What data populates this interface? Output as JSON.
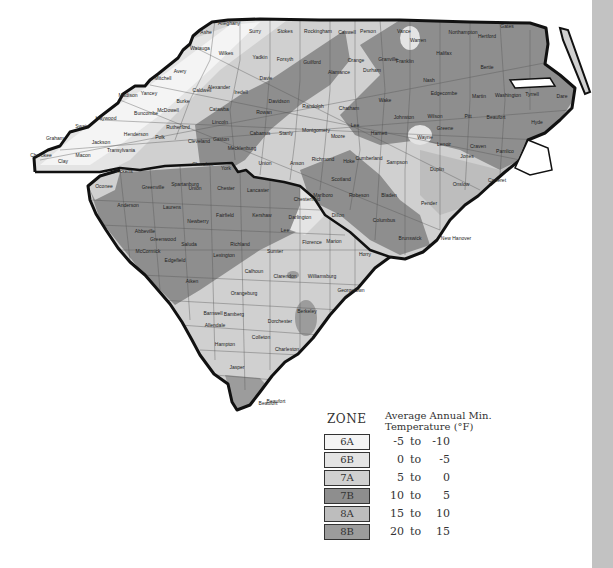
{
  "map": {
    "title": "USDA Plant Hardiness Zones — North Carolina & South Carolina",
    "states": [
      "North Carolina",
      "South Carolina"
    ],
    "nc_counties": [
      {
        "name": "Ashe",
        "x": 206,
        "y": 34
      },
      {
        "name": "Alleghany",
        "x": 229,
        "y": 25
      },
      {
        "name": "Surry",
        "x": 255,
        "y": 33
      },
      {
        "name": "Stokes",
        "x": 285,
        "y": 33
      },
      {
        "name": "Rockingham",
        "x": 318,
        "y": 33
      },
      {
        "name": "Caswell",
        "x": 347,
        "y": 34
      },
      {
        "name": "Person",
        "x": 368,
        "y": 33
      },
      {
        "name": "Vance",
        "x": 404,
        "y": 33
      },
      {
        "name": "Warren",
        "x": 418,
        "y": 42
      },
      {
        "name": "Northampton",
        "x": 463,
        "y": 34
      },
      {
        "name": "Hertford",
        "x": 487,
        "y": 38
      },
      {
        "name": "Gates",
        "x": 507,
        "y": 28
      },
      {
        "name": "Watauga",
        "x": 200,
        "y": 50
      },
      {
        "name": "Wilkes",
        "x": 226,
        "y": 55
      },
      {
        "name": "Yadkin",
        "x": 260,
        "y": 59
      },
      {
        "name": "Forsyth",
        "x": 285,
        "y": 61
      },
      {
        "name": "Guilford",
        "x": 312,
        "y": 64
      },
      {
        "name": "Alamance",
        "x": 339,
        "y": 74
      },
      {
        "name": "Orange",
        "x": 356,
        "y": 62
      },
      {
        "name": "Durham",
        "x": 372,
        "y": 72
      },
      {
        "name": "Granville",
        "x": 388,
        "y": 61
      },
      {
        "name": "Franklin",
        "x": 405,
        "y": 63
      },
      {
        "name": "Halifax",
        "x": 444,
        "y": 55
      },
      {
        "name": "Bertie",
        "x": 487,
        "y": 69
      },
      {
        "name": "Avery",
        "x": 180,
        "y": 73
      },
      {
        "name": "Mitchell",
        "x": 163,
        "y": 80
      },
      {
        "name": "Yancey",
        "x": 149,
        "y": 95
      },
      {
        "name": "Madison",
        "x": 128,
        "y": 97
      },
      {
        "name": "Caldwell",
        "x": 202,
        "y": 92
      },
      {
        "name": "Alexander",
        "x": 219,
        "y": 89
      },
      {
        "name": "Iredell",
        "x": 241,
        "y": 94
      },
      {
        "name": "Davie",
        "x": 266,
        "y": 80
      },
      {
        "name": "Davidson",
        "x": 279,
        "y": 103
      },
      {
        "name": "Randolph",
        "x": 313,
        "y": 108
      },
      {
        "name": "Chatham",
        "x": 349,
        "y": 110
      },
      {
        "name": "Wake",
        "x": 385,
        "y": 102
      },
      {
        "name": "Nash",
        "x": 429,
        "y": 82
      },
      {
        "name": "Edgecombe",
        "x": 444,
        "y": 95
      },
      {
        "name": "Martin",
        "x": 479,
        "y": 98
      },
      {
        "name": "Washington",
        "x": 508,
        "y": 97
      },
      {
        "name": "Tyrrell",
        "x": 532,
        "y": 96
      },
      {
        "name": "Dare",
        "x": 562,
        "y": 98
      },
      {
        "name": "Buncombe",
        "x": 146,
        "y": 115
      },
      {
        "name": "McDowell",
        "x": 168,
        "y": 112
      },
      {
        "name": "Burke",
        "x": 183,
        "y": 103
      },
      {
        "name": "Catawba",
        "x": 219,
        "y": 111
      },
      {
        "name": "Rowan",
        "x": 264,
        "y": 114
      },
      {
        "name": "Wilson",
        "x": 435,
        "y": 118
      },
      {
        "name": "Johnston",
        "x": 404,
        "y": 119
      },
      {
        "name": "Pitt",
        "x": 468,
        "y": 118
      },
      {
        "name": "Beaufort",
        "x": 496,
        "y": 119
      },
      {
        "name": "Hyde",
        "x": 537,
        "y": 124
      },
      {
        "name": "Haywood",
        "x": 106,
        "y": 120
      },
      {
        "name": "Swain",
        "x": 82,
        "y": 128
      },
      {
        "name": "Graham",
        "x": 55,
        "y": 140
      },
      {
        "name": "Cherokee",
        "x": 41,
        "y": 157
      },
      {
        "name": "Clay",
        "x": 63,
        "y": 163
      },
      {
        "name": "Macon",
        "x": 83,
        "y": 157
      },
      {
        "name": "Jackson",
        "x": 101,
        "y": 144
      },
      {
        "name": "Henderson",
        "x": 136,
        "y": 136
      },
      {
        "name": "Transylvania",
        "x": 121,
        "y": 152
      },
      {
        "name": "Polk",
        "x": 160,
        "y": 139
      },
      {
        "name": "Rutherford",
        "x": 178,
        "y": 129
      },
      {
        "name": "Cleveland",
        "x": 199,
        "y": 143
      },
      {
        "name": "Lincoln",
        "x": 220,
        "y": 124
      },
      {
        "name": "Gaston",
        "x": 221,
        "y": 141
      },
      {
        "name": "Cabarrus",
        "x": 260,
        "y": 135
      },
      {
        "name": "Stanly",
        "x": 286,
        "y": 135
      },
      {
        "name": "Montgomery",
        "x": 316,
        "y": 132
      },
      {
        "name": "Moore",
        "x": 338,
        "y": 138
      },
      {
        "name": "Lee",
        "x": 355,
        "y": 127
      },
      {
        "name": "Harnett",
        "x": 379,
        "y": 135
      },
      {
        "name": "Greene",
        "x": 445,
        "y": 130
      },
      {
        "name": "Wayne",
        "x": 425,
        "y": 139
      },
      {
        "name": "Lenoir",
        "x": 444,
        "y": 146
      },
      {
        "name": "Craven",
        "x": 478,
        "y": 148
      },
      {
        "name": "Pamlico",
        "x": 505,
        "y": 153
      },
      {
        "name": "Mecklenburg",
        "x": 242,
        "y": 150
      },
      {
        "name": "Union",
        "x": 265,
        "y": 165
      },
      {
        "name": "Anson",
        "x": 297,
        "y": 165
      },
      {
        "name": "Richmond",
        "x": 323,
        "y": 161
      },
      {
        "name": "Hoke",
        "x": 349,
        "y": 163
      },
      {
        "name": "Scotland",
        "x": 341,
        "y": 181
      },
      {
        "name": "Cumberland",
        "x": 369,
        "y": 160
      },
      {
        "name": "Sampson",
        "x": 397,
        "y": 164
      },
      {
        "name": "Duplin",
        "x": 437,
        "y": 171
      },
      {
        "name": "Jones",
        "x": 467,
        "y": 158
      },
      {
        "name": "Onslow",
        "x": 461,
        "y": 186
      },
      {
        "name": "Carteret",
        "x": 497,
        "y": 182
      },
      {
        "name": "Robeson",
        "x": 359,
        "y": 197
      },
      {
        "name": "Bladen",
        "x": 389,
        "y": 197
      },
      {
        "name": "Pender",
        "x": 429,
        "y": 205
      },
      {
        "name": "Columbus",
        "x": 384,
        "y": 222
      },
      {
        "name": "Brunswick",
        "x": 410,
        "y": 240
      },
      {
        "name": "New Hanover",
        "x": 456,
        "y": 240
      }
    ],
    "sc_counties": [
      {
        "name": "Cherokee",
        "x": 203,
        "y": 166
      },
      {
        "name": "York",
        "x": 226,
        "y": 170
      },
      {
        "name": "Pickens",
        "x": 124,
        "y": 173
      },
      {
        "name": "Oconee",
        "x": 104,
        "y": 188
      },
      {
        "name": "Spartanburg",
        "x": 185,
        "y": 186
      },
      {
        "name": "Greenville",
        "x": 153,
        "y": 189
      },
      {
        "name": "Union",
        "x": 195,
        "y": 190
      },
      {
        "name": "Chester",
        "x": 226,
        "y": 190
      },
      {
        "name": "Lancaster",
        "x": 258,
        "y": 192
      },
      {
        "name": "Chesterfield",
        "x": 307,
        "y": 201
      },
      {
        "name": "Marlboro",
        "x": 323,
        "y": 197
      },
      {
        "name": "Dillon",
        "x": 338,
        "y": 217
      },
      {
        "name": "Anderson",
        "x": 128,
        "y": 207
      },
      {
        "name": "Laurens",
        "x": 172,
        "y": 209
      },
      {
        "name": "Newberry",
        "x": 198,
        "y": 223
      },
      {
        "name": "Fairfield",
        "x": 225,
        "y": 217
      },
      {
        "name": "Kershaw",
        "x": 262,
        "y": 217
      },
      {
        "name": "Darlington",
        "x": 300,
        "y": 219
      },
      {
        "name": "Lee",
        "x": 285,
        "y": 232
      },
      {
        "name": "Abbeville",
        "x": 145,
        "y": 233
      },
      {
        "name": "Greenwood",
        "x": 163,
        "y": 241
      },
      {
        "name": "McCormick",
        "x": 148,
        "y": 253
      },
      {
        "name": "Saluda",
        "x": 189,
        "y": 246
      },
      {
        "name": "Edgefield",
        "x": 175,
        "y": 262
      },
      {
        "name": "Richland",
        "x": 240,
        "y": 246
      },
      {
        "name": "Lexington",
        "x": 224,
        "y": 257
      },
      {
        "name": "Sumter",
        "x": 275,
        "y": 253
      },
      {
        "name": "Florence",
        "x": 312,
        "y": 244
      },
      {
        "name": "Marion",
        "x": 334,
        "y": 243
      },
      {
        "name": "Horry",
        "x": 365,
        "y": 256
      },
      {
        "name": "Aiken",
        "x": 192,
        "y": 283
      },
      {
        "name": "Calhoun",
        "x": 254,
        "y": 273
      },
      {
        "name": "Clarendon",
        "x": 285,
        "y": 278
      },
      {
        "name": "Williamsburg",
        "x": 322,
        "y": 278
      },
      {
        "name": "Orangeburg",
        "x": 244,
        "y": 295
      },
      {
        "name": "Georgetown",
        "x": 351,
        "y": 292
      },
      {
        "name": "Barnwell",
        "x": 213,
        "y": 315
      },
      {
        "name": "Bamberg",
        "x": 234,
        "y": 316
      },
      {
        "name": "Berkeley",
        "x": 307,
        "y": 313
      },
      {
        "name": "Dorchester",
        "x": 280,
        "y": 323
      },
      {
        "name": "Allendale",
        "x": 215,
        "y": 327
      },
      {
        "name": "Colleton",
        "x": 261,
        "y": 339
      },
      {
        "name": "Hampton",
        "x": 225,
        "y": 346
      },
      {
        "name": "Charleston",
        "x": 287,
        "y": 351
      },
      {
        "name": "Jasper",
        "x": 237,
        "y": 369
      },
      {
        "name": "Beaufort",
        "x": 276,
        "y": 403
      }
    ],
    "colors": {
      "6A": "#f4f4f4",
      "6B": "#e4e4e4",
      "7A": "#d0d0d0",
      "7B": "#8e8e8e",
      "8A": "#bdbdbd",
      "8B": "#9c9c9c",
      "border": "#111111",
      "county_line": "#555555",
      "water": "#ffffff",
      "side_bar": "#c2c2c2"
    }
  },
  "legend": {
    "zone_title": "ZONE",
    "temp_title_line1": "Average Annual Min.",
    "temp_title_line2": "Temperature (°F)",
    "zones": [
      {
        "zone": "6A",
        "low": "-5",
        "to": "to",
        "high": "-10",
        "color": "#f4f4f4"
      },
      {
        "zone": "6B",
        "low": "0",
        "to": "to",
        "high": "-5",
        "color": "#e4e4e4"
      },
      {
        "zone": "7A",
        "low": "5",
        "to": "to",
        "high": "0",
        "color": "#d0d0d0"
      },
      {
        "zone": "7B",
        "low": "10",
        "to": "to",
        "high": "5",
        "color": "#8e8e8e"
      },
      {
        "zone": "8A",
        "low": "15",
        "to": "to",
        "high": "10",
        "color": "#bdbdbd"
      },
      {
        "zone": "8B",
        "low": "20",
        "to": "to",
        "high": "15",
        "color": "#9c9c9c"
      }
    ]
  }
}
